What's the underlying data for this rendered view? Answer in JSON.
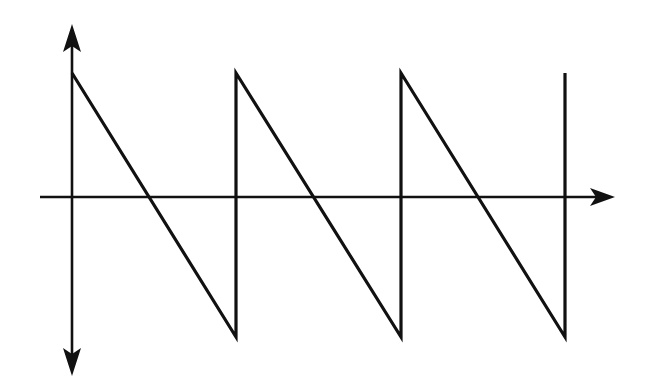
{
  "diagram": {
    "type": "sawtooth-waveform",
    "title": "",
    "colors": {
      "background": "#ffffff",
      "stroke": "#111111"
    },
    "axes": {
      "origin": [
        72,
        197
      ],
      "x_axis": {
        "from": [
          40,
          197
        ],
        "to": [
          615,
          197
        ],
        "arrow": "right"
      },
      "y_axis": {
        "from": [
          72,
          375
        ],
        "to": [
          72,
          25
        ],
        "arrows": [
          "up",
          "down"
        ]
      }
    },
    "waveform": {
      "shape": "falling-sawtooth",
      "periods": 3,
      "peak_y": 73,
      "trough_y": 337,
      "period_starts_x": [
        72,
        236,
        401
      ],
      "final_edge_x": 565,
      "zero_crossings_x": [
        148,
        312,
        478
      ],
      "points": [
        [
          72,
          73
        ],
        [
          236,
          337
        ],
        [
          236,
          73
        ],
        [
          401,
          337
        ],
        [
          401,
          73
        ],
        [
          565,
          337
        ],
        [
          565,
          73
        ]
      ]
    },
    "labels": []
  }
}
